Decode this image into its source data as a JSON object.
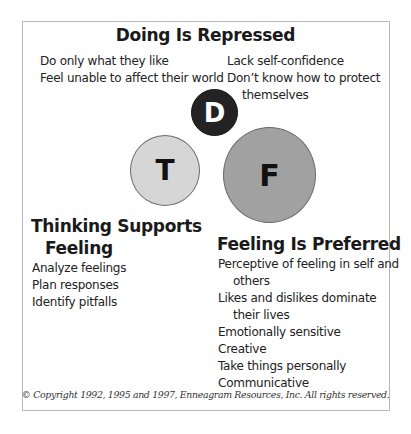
{
  "diagram": {
    "doing": {
      "title": "Doing Is Repressed",
      "left_items": [
        "Do only what they like",
        "Feel unable to affect their world"
      ],
      "right_items": [
        {
          "line1": "Lack self-confidence",
          "line2": ""
        },
        {
          "line1": "Don’t know how to protect",
          "line2": "themselves"
        }
      ]
    },
    "circles": {
      "d": {
        "letter": "D",
        "fill": "#232323",
        "text_color": "#ffffff"
      },
      "t": {
        "letter": "T",
        "fill": "#d6d6d6",
        "text_color": "#111111"
      },
      "f": {
        "letter": "F",
        "fill": "#a1a1a1",
        "text_color": "#111111"
      }
    },
    "thinking": {
      "title_line1": "Thinking Supports",
      "title_line2": "Feeling",
      "items": [
        "Analyze feelings",
        "Plan responses",
        "Identify pitfalls"
      ]
    },
    "feeling": {
      "title": "Feeling Is Preferred",
      "items": [
        {
          "line1": "Perceptive of feeling in self and",
          "line2": "others"
        },
        {
          "line1": "Likes and dislikes dominate",
          "line2": "their lives"
        },
        {
          "line1": "Emotionally sensitive",
          "line2": ""
        },
        {
          "line1": "Creative",
          "line2": ""
        },
        {
          "line1": "Take things personally",
          "line2": ""
        },
        {
          "line1": "Communicative",
          "line2": ""
        }
      ]
    },
    "copyright": "© Copyright 1992, 1995 and 1997, Enneagram Resources, Inc. All rights reserved."
  }
}
